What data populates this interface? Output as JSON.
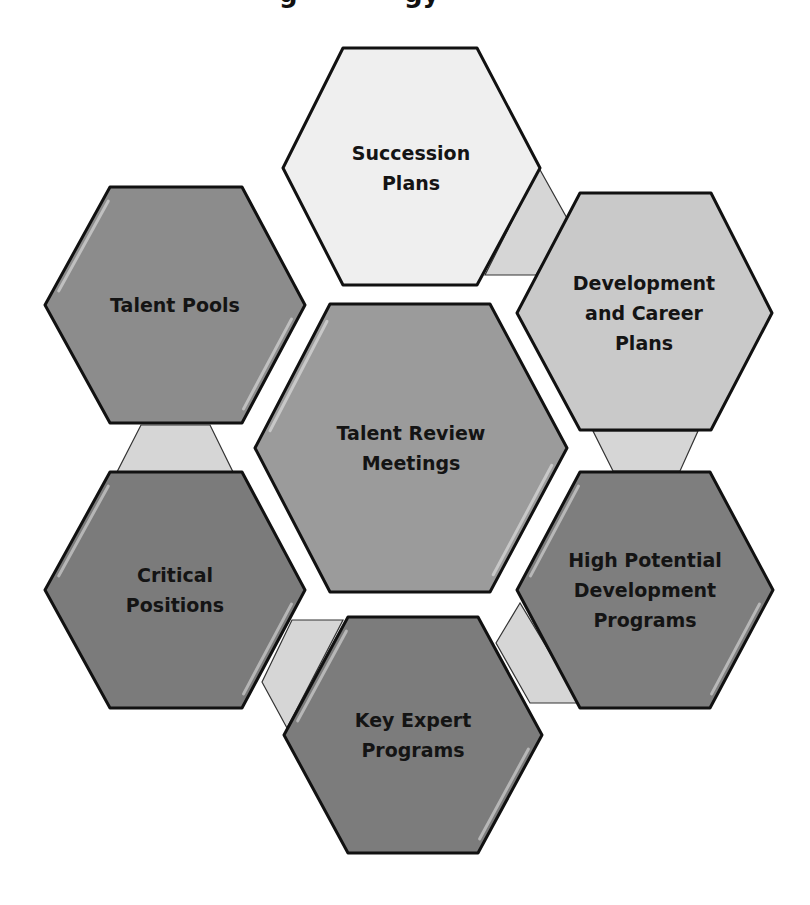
{
  "title": {
    "visible_fragments": [
      {
        "text": "g",
        "x": 279
      },
      {
        "text": "gy",
        "x": 404
      }
    ]
  },
  "colors": {
    "background": "#ffffff",
    "outline": "#111111",
    "connector": "#d6d6d6",
    "text": "#141414"
  },
  "hexagons": [
    {
      "id": "succession-plans",
      "lines": [
        "Succession",
        "Plans"
      ],
      "fill": "#efefef",
      "points": "343,48 477,48 540,168 477,285 343,285 283,168",
      "cx": 411,
      "cy": 168
    },
    {
      "id": "talent-pools",
      "lines": [
        "Talent Pools"
      ],
      "fill": "#8c8c8c",
      "points": "110,187 242,187 305,305 242,423 110,423 45,305",
      "cx": 175,
      "cy": 305
    },
    {
      "id": "development-and-career-plans",
      "lines": [
        "Development",
        "and Career",
        "Plans"
      ],
      "fill": "#c9c9c9",
      "points": "580,193 711,193 772,313 711,430 580,430 517,313",
      "cx": 644,
      "cy": 313
    },
    {
      "id": "talent-review-meetings",
      "lines": [
        "Talent Review",
        "Meetings"
      ],
      "fill": "#9b9b9b",
      "points": "330,304 490,304 567,448 490,592 330,592 255,448",
      "cx": 411,
      "cy": 448
    },
    {
      "id": "critical-positions",
      "lines": [
        "Critical",
        "Positions"
      ],
      "fill": "#7b7b7b",
      "points": "110,472 242,472 305,590 242,708 110,708 45,590",
      "cx": 175,
      "cy": 590
    },
    {
      "id": "high-potential-development-programs",
      "lines": [
        "High Potential",
        "Development",
        "Programs"
      ],
      "fill": "#7e7e7e",
      "points": "580,472 710,472 773,590 710,708 580,708 517,590",
      "cx": 645,
      "cy": 590
    },
    {
      "id": "key-expert-programs",
      "lines": [
        "Key Expert",
        "Programs"
      ],
      "fill": "#7c7c7c",
      "points": "348,617 478,617 542,735 478,853 348,853 284,735",
      "cx": 413,
      "cy": 735
    }
  ],
  "connectors": [
    {
      "id": "succession-to-development",
      "points": "539,168 568,220 536,275 485,275"
    },
    {
      "id": "development-to-high-potential",
      "points": "593,431 698,431 680,471 613,471"
    },
    {
      "id": "high-potential-to-key-expert",
      "points": "520,603 496,643 530,703 580,703"
    },
    {
      "id": "key-expert-to-critical-positions",
      "points": "292,620 343,620 287,728 262,682"
    },
    {
      "id": "talent-pools-to-critical-positions",
      "points": "141,425 210,425 233,472 117,472"
    }
  ]
}
